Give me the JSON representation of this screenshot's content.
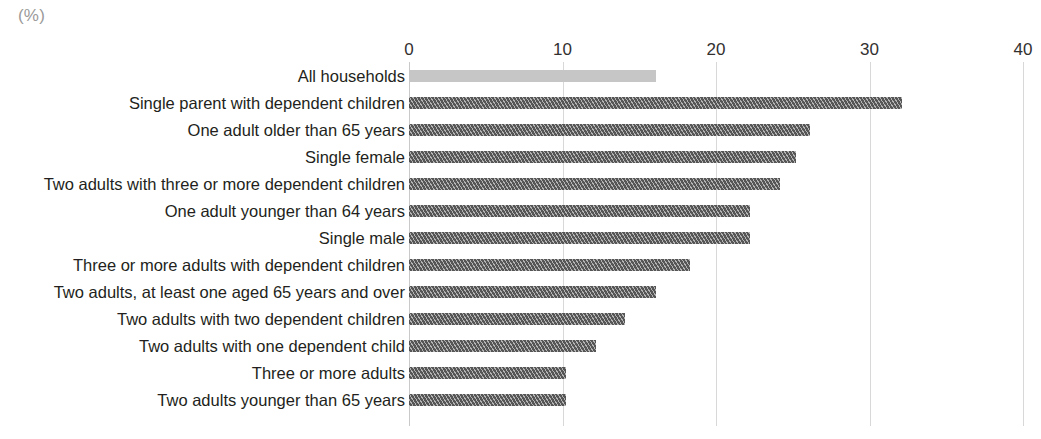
{
  "chart_data": {
    "type": "bar",
    "orientation": "horizontal",
    "title": "",
    "subtitle": "",
    "unit_label": "(%)",
    "xlabel": "",
    "ylabel": "",
    "xlim": [
      0,
      40
    ],
    "xticks": [
      "0",
      "10",
      "20",
      "30",
      "40"
    ],
    "xtick_values": [
      0,
      10,
      20,
      30,
      40
    ],
    "grid": true,
    "legend": "none",
    "categories": [
      "All households",
      "Single parent with dependent children",
      "One adult older than 65 years",
      "Single female",
      "Two adults with three or more dependent children",
      "One adult younger than 64 years",
      "Single male",
      "Three or more adults with dependent children",
      "Two adults, at least one aged 65 years and over",
      "Two adults with two dependent children",
      "Two adults with one dependent child",
      "Three or more adults",
      "Two adults younger than 65 years"
    ],
    "values": [
      16.1,
      32.1,
      26.1,
      25.2,
      24.2,
      22.2,
      22.2,
      18.3,
      16.1,
      14.1,
      12.2,
      10.2,
      10.2
    ],
    "styles": [
      "solid",
      "hatched",
      "hatched",
      "hatched",
      "hatched",
      "hatched",
      "hatched",
      "hatched",
      "hatched",
      "hatched",
      "hatched",
      "hatched",
      "hatched"
    ],
    "colors": {
      "bar_highlight": "#c6c6c6",
      "bar_default": "#565656",
      "gridline": "#d8d8d8",
      "axis": "#c9c9c9",
      "text": "#231f20",
      "unit_text": "#9a9a9a",
      "background": "#ffffff"
    }
  }
}
